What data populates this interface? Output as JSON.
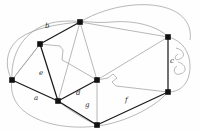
{
  "figure": {
    "kind": "planar-graph-diagram",
    "background": "#fefefe",
    "width": 200,
    "height": 132,
    "colors": {
      "tree_edge": "#1a1a1a",
      "cotree_edge": "#9a9a9a",
      "vertex": "#111111",
      "label": "#2b2b2b"
    }
  },
  "vertices": [
    {
      "id": "v_top",
      "name": "vertex-top",
      "x": 80,
      "y": 22
    },
    {
      "id": "v_upper_left",
      "name": "vertex-upper-left",
      "x": 40,
      "y": 44
    },
    {
      "id": "v_left",
      "name": "vertex-left",
      "x": 12,
      "y": 80
    },
    {
      "id": "v_lower_left",
      "name": "vertex-lower-left",
      "x": 58,
      "y": 101
    },
    {
      "id": "v_center",
      "name": "vertex-center",
      "x": 97,
      "y": 80
    },
    {
      "id": "v_bottom",
      "name": "vertex-bottom",
      "x": 97,
      "y": 125
    },
    {
      "id": "v_right_top",
      "name": "vertex-right-top",
      "x": 168,
      "y": 37
    },
    {
      "id": "v_right_bottom",
      "name": "vertex-right-bottom",
      "x": 168,
      "y": 92
    }
  ],
  "tree_edges": [
    {
      "name": "edge-b",
      "from": "v_upper_left",
      "to": "v_top",
      "label": "b"
    },
    {
      "name": "edge-e",
      "from": "v_upper_left",
      "to": "v_lower_left",
      "label": "e"
    },
    {
      "name": "edge-a",
      "from": "v_left",
      "to": "v_lower_left",
      "label": "a"
    },
    {
      "name": "edge-d",
      "from": "v_lower_left",
      "to": "v_center",
      "label": "d"
    },
    {
      "name": "edge-g",
      "from": "v_lower_left",
      "to": "v_bottom",
      "label": "g"
    },
    {
      "name": "edge-f",
      "from": "v_bottom",
      "to": "v_right_bottom",
      "label": "f"
    },
    {
      "name": "edge-c",
      "from": "v_right_top",
      "to": "v_right_bottom",
      "label": "c"
    }
  ],
  "cotree_edges": [
    {
      "name": "cotree-top-center",
      "from": "v_top",
      "to": "v_center"
    },
    {
      "name": "cotree-top-lowerleft",
      "from": "v_top",
      "to": "v_lower_left"
    },
    {
      "name": "cotree-top-righttop",
      "from": "v_top",
      "to": "v_right_top"
    },
    {
      "name": "cotree-upperleft-left",
      "from": "v_upper_left",
      "to": "v_left"
    },
    {
      "name": "cotree-upperleft-center",
      "from": "v_upper_left",
      "to": "v_center"
    },
    {
      "name": "cotree-center-bottom",
      "from": "v_center",
      "to": "v_bottom"
    },
    {
      "name": "cotree-center-rightbottom",
      "from": "v_center",
      "to": "v_right_bottom"
    },
    {
      "name": "cotree-center-righttop",
      "from": "v_center",
      "to": "v_right_top"
    },
    {
      "name": "cotree-outer-left-top",
      "from": "v_left",
      "to": "v_top"
    },
    {
      "name": "cotree-outer-loop",
      "from": "v_left",
      "to": "v_bottom"
    }
  ],
  "labels": [
    {
      "name": "edge-label-b",
      "text": "b",
      "x": 45,
      "y": 23
    },
    {
      "name": "edge-label-e",
      "text": "e",
      "x": 39,
      "y": 70
    },
    {
      "name": "edge-label-a",
      "text": "a",
      "x": 34,
      "y": 95
    },
    {
      "name": "edge-label-d",
      "text": "d",
      "x": 76,
      "y": 90
    },
    {
      "name": "edge-label-g",
      "text": "g",
      "x": 85,
      "y": 102
    },
    {
      "name": "edge-label-f",
      "text": "f",
      "x": 125,
      "y": 97
    },
    {
      "name": "edge-label-c",
      "text": "c",
      "x": 170,
      "y": 58
    }
  ]
}
